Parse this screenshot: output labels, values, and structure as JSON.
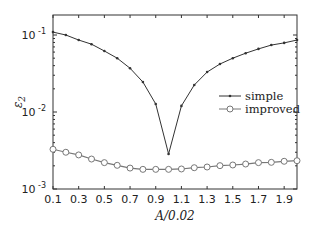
{
  "chart_data": {
    "type": "line",
    "title": "",
    "xlabel": "A/0.02",
    "ylabel": "ε2",
    "yscale": "log",
    "xlim": [
      0.1,
      2.0
    ],
    "ylim": [
      0.001,
      0.186
    ],
    "grid": false,
    "legend_position": "center-right",
    "x_ticks": [
      0.1,
      0.3,
      0.5,
      0.7,
      0.9,
      1.1,
      1.3,
      1.5,
      1.7,
      1.9
    ],
    "x_tick_labels": [
      "0.1",
      "0.3",
      "0.5",
      "0.7",
      "0.9",
      "1.1",
      "1.3",
      "1.5",
      "1.7",
      "1.9"
    ],
    "y_ticks": [
      0.001,
      0.01,
      0.1
    ],
    "y_tick_labels": [
      {
        "base": "10",
        "exp": "-3"
      },
      {
        "base": "10",
        "exp": "-2"
      },
      {
        "base": "10",
        "exp": "-1"
      }
    ],
    "x": [
      0.1,
      0.2,
      0.3,
      0.4,
      0.5,
      0.6,
      0.7,
      0.8,
      0.9,
      1.0,
      1.1,
      1.2,
      1.3,
      1.4,
      1.5,
      1.6,
      1.7,
      1.8,
      1.9,
      2.0
    ],
    "series": [
      {
        "name": "simple",
        "marker": "dot",
        "color": "#333333",
        "values": [
          0.109,
          0.1,
          0.086,
          0.076,
          0.062,
          0.05,
          0.037,
          0.0245,
          0.0127,
          0.00285,
          0.012,
          0.0224,
          0.033,
          0.042,
          0.05,
          0.058,
          0.066,
          0.074,
          0.079,
          0.086
        ]
      },
      {
        "name": "improved",
        "marker": "circle",
        "color": "#777777",
        "values": [
          0.00328,
          0.003,
          0.00277,
          0.00245,
          0.0022,
          0.00203,
          0.00187,
          0.0018,
          0.0018,
          0.0018,
          0.00182,
          0.00189,
          0.00193,
          0.00201,
          0.00205,
          0.00211,
          0.0022,
          0.00222,
          0.00229,
          0.00233
        ]
      }
    ]
  }
}
